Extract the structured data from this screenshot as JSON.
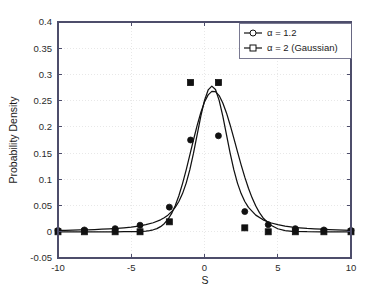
{
  "figure": {
    "background_color": "#ffffff",
    "axes_color": "#4d4d6b",
    "line_color": "#111111",
    "grid_color": "#d8d8d8"
  },
  "chart_data": {
    "type": "line",
    "title": "",
    "subtitle": "",
    "xlabel": "S",
    "ylabel": "Probability Density",
    "xlim": [
      -10,
      10
    ],
    "ylim": [
      -0.05,
      0.4
    ],
    "xticks": [
      -10,
      -5,
      0,
      5,
      10
    ],
    "xtick_labels": [
      "-10",
      "-5",
      "0",
      "5",
      "10"
    ],
    "yticks": [
      -0.05,
      0,
      0.05,
      0.1,
      0.15,
      0.2,
      0.25,
      0.3,
      0.35,
      0.4
    ],
    "ytick_labels": [
      "-0.05",
      "0",
      "0.05",
      "0.1",
      "0.15",
      "0.2",
      "0.25",
      "0.3",
      "0.35",
      "0.4"
    ],
    "grid": true,
    "legend_position": "top-right",
    "series": [
      {
        "name": "alpha = 1.2",
        "legend_label": "α = 1.2",
        "marker": "circle",
        "color": "#111111",
        "marker_x": [
          -10,
          -8.2,
          -6.1,
          -4.4,
          -2.4,
          -0.95,
          0.95,
          2.75,
          4.35,
          6.2,
          8.15,
          10
        ],
        "marker_y": [
          0.0025,
          0.0035,
          0.006,
          0.0125,
          0.047,
          0.175,
          0.183,
          0.0385,
          0.0135,
          0.006,
          0.0035,
          0.0025
        ],
        "x": [
          -10,
          -9.5,
          -9,
          -8.5,
          -8,
          -7.5,
          -7,
          -6.5,
          -6,
          -5.5,
          -5,
          -4.5,
          -4,
          -3.5,
          -3,
          -2.75,
          -2.5,
          -2.25,
          -2,
          -1.75,
          -1.5,
          -1.25,
          -1,
          -0.75,
          -0.5,
          -0.25,
          0,
          0.25,
          0.5,
          0.75,
          1,
          1.25,
          1.5,
          1.75,
          2,
          2.25,
          2.5,
          2.75,
          3,
          3.5,
          4,
          4.5,
          5,
          5.5,
          6,
          6.5,
          7,
          7.5,
          8,
          8.5,
          9,
          9.5,
          10
        ],
        "y": [
          0.0025,
          0.0027,
          0.003,
          0.0034,
          0.0038,
          0.0043,
          0.0049,
          0.0056,
          0.0064,
          0.0076,
          0.009,
          0.0109,
          0.0135,
          0.0172,
          0.0228,
          0.0267,
          0.0317,
          0.0381,
          0.0466,
          0.0578,
          0.0728,
          0.0928,
          0.1185,
          0.1499,
          0.1853,
          0.2205,
          0.2505,
          0.2705,
          0.2778,
          0.2712,
          0.2505,
          0.2205,
          0.1853,
          0.1499,
          0.1185,
          0.0928,
          0.0728,
          0.0578,
          0.0466,
          0.0317,
          0.0228,
          0.0172,
          0.0135,
          0.0109,
          0.009,
          0.0076,
          0.0064,
          0.0056,
          0.0049,
          0.0043,
          0.0038,
          0.0031,
          0.0025
        ]
      },
      {
        "name": "alpha = 2 (Gaussian)",
        "legend_label": "α = 2 (Gaussian)",
        "marker": "square",
        "color": "#111111",
        "marker_x": [
          -10,
          -8.2,
          -6.1,
          -4.4,
          -2.4,
          -0.95,
          0.95,
          2.75,
          4.35,
          6.2,
          8.15,
          10
        ],
        "marker_y": [
          0.0,
          0.0,
          0.0,
          0.0,
          0.019,
          0.2845,
          0.2845,
          0.0075,
          0.0,
          0.0,
          0.0,
          0.0
        ],
        "x": [
          -10,
          -9,
          -8,
          -7,
          -6,
          -5.5,
          -5,
          -4.5,
          -4,
          -3.75,
          -3.5,
          -3.25,
          -3,
          -2.75,
          -2.5,
          -2.25,
          -2,
          -1.75,
          -1.5,
          -1.25,
          -1,
          -0.75,
          -0.5,
          -0.25,
          0,
          0.25,
          0.5,
          0.75,
          1,
          1.25,
          1.5,
          1.75,
          2,
          2.25,
          2.5,
          2.75,
          3,
          3.25,
          3.5,
          3.75,
          4,
          4.5,
          5,
          5.5,
          6,
          7,
          8,
          9,
          10
        ],
        "y": [
          0.0,
          0.0,
          0.0,
          0.0,
          0.0,
          0.0001,
          0.0002,
          0.0004,
          0.0013,
          0.0022,
          0.0038,
          0.0061,
          0.0098,
          0.0154,
          0.0234,
          0.0345,
          0.0495,
          0.0686,
          0.0919,
          0.1182,
          0.1466,
          0.1755,
          0.2029,
          0.2275,
          0.2473,
          0.2611,
          0.2678,
          0.2673,
          0.2597,
          0.2457,
          0.2266,
          0.2037,
          0.1786,
          0.1528,
          0.1277,
          0.1042,
          0.0831,
          0.0647,
          0.0492,
          0.0365,
          0.0264,
          0.013,
          0.0058,
          0.0024,
          0.0009,
          0.0001,
          0.0,
          0.0,
          0.0
        ]
      }
    ]
  }
}
